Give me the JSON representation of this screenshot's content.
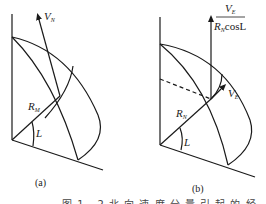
{
  "figure": {
    "panel_a": {
      "label": "(a)",
      "velocity_label": "V",
      "velocity_sub": "N",
      "radius_label": "R",
      "radius_sub": "M",
      "angle_label": "L"
    },
    "panel_b": {
      "label": "(b)",
      "fraction_numerator": "V",
      "fraction_numerator_sub": "E",
      "fraction_denominator_R": "R",
      "fraction_denominator_sub": "N",
      "fraction_denominator_rest": "cosL",
      "velocity_label": "V",
      "velocity_sub": "E",
      "radius_label": "R",
      "radius_sub": "N",
      "angle_label": "L"
    },
    "caption_partial": "图 1 - 2   北 向 速 度 分 量 引 起 的 经 纬 度 变 化"
  },
  "colors": {
    "line": "#1a1a1a",
    "background": "#ffffff"
  }
}
